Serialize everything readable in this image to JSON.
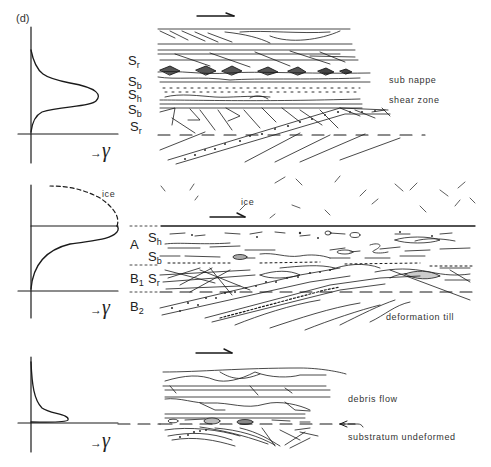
{
  "figure": {
    "panel_tag": "(d)",
    "axis_symbol": "→ γ",
    "gamma_glyph": "γ",
    "colors": {
      "ink": "#1a1a1a",
      "background": "#ffffff"
    }
  },
  "panels": [
    {
      "id": "top",
      "layer_labels": [
        {
          "main": "S",
          "sub": "r"
        },
        {
          "main": "S",
          "sub": "b"
        },
        {
          "main": "S",
          "sub": "h"
        },
        {
          "main": "S",
          "sub": "b"
        },
        {
          "main": "S",
          "sub": "r"
        }
      ],
      "annotations": [
        "sub nappe",
        "shear zone"
      ],
      "profile": "symmetric bell-shaped strain peak centered at Sh"
    },
    {
      "id": "middle",
      "profile_label": "ice",
      "section_label": "ice",
      "zone_labels": [
        "A",
        "B",
        "B"
      ],
      "zone_subs": [
        "",
        "1",
        "2"
      ],
      "layer_labels": [
        {
          "main": "S",
          "sub": "h"
        },
        {
          "main": "S",
          "sub": "b"
        },
        {
          "main": "S",
          "sub": "r"
        }
      ],
      "annotations": [
        "deformation till"
      ],
      "profile": "strain increasing upward to ice contact, dashed continuation into ice"
    },
    {
      "id": "bottom",
      "annotations": [
        "debris flow",
        "substratum undeformed"
      ],
      "profile": "sharp strain spike at base, decaying upward"
    }
  ]
}
